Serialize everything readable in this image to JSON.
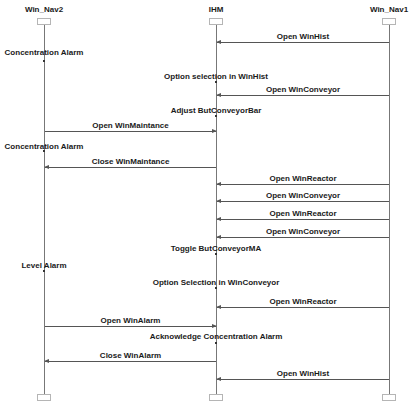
{
  "lifelines": [
    {
      "id": "nav2",
      "label": "Win_Nav2",
      "x": 44
    },
    {
      "id": "ihm",
      "label": "IHM",
      "x": 216
    },
    {
      "id": "nav1",
      "label": "Win_Nav1",
      "x": 389
    }
  ],
  "messages": [
    {
      "label": "Open WinHist",
      "from": "Win_Nav1",
      "to": "IHM",
      "y": 42
    },
    {
      "label": "Open WinConveyor",
      "from": "Win_Nav1",
      "to": "IHM",
      "y": 95
    },
    {
      "label": "Open WinMaintance",
      "from": "Win_Nav2",
      "to": "IHM",
      "y": 131
    },
    {
      "label": "Close WinMaintance",
      "from": "IHM",
      "to": "Win_Nav2",
      "y": 167
    },
    {
      "label": "Open WinReactor",
      "from": "Win_Nav1",
      "to": "IHM",
      "y": 184
    },
    {
      "label": "Open WinConveyor",
      "from": "Win_Nav1",
      "to": "IHM",
      "y": 201
    },
    {
      "label": "Open WinReactor",
      "from": "Win_Nav1",
      "to": "IHM",
      "y": 219
    },
    {
      "label": "Open WinConveyor",
      "from": "Win_Nav1",
      "to": "IHM",
      "y": 237
    },
    {
      "label": "Open WinReactor",
      "from": "Win_Nav1",
      "to": "IHM",
      "y": 307
    },
    {
      "label": "Open WinAlarm",
      "from": "Win_Nav2",
      "to": "IHM",
      "y": 326
    },
    {
      "label": "Close WinAlarm",
      "from": "IHM",
      "to": "Win_Nav2",
      "y": 361
    },
    {
      "label": "Open WinHist",
      "from": "Win_Nav1",
      "to": "IHM",
      "y": 379
    }
  ],
  "events": [
    {
      "label": "Concentration Alarm",
      "on": "Win_Nav2",
      "y": 51
    },
    {
      "label": "Option selection  in WinHist",
      "on": "IHM",
      "y": 75
    },
    {
      "label": "Adjust ButConveyorBar",
      "on": "IHM",
      "y": 109
    },
    {
      "label": "Concentration Alarm",
      "on": "Win_Nav2",
      "y": 145
    },
    {
      "label": "Toggle ButConveyorMA",
      "on": "IHM",
      "y": 247
    },
    {
      "label": "Level Alarm",
      "on": "Win_Nav2",
      "y": 264
    },
    {
      "label": "Option Selection in WinConveyor",
      "on": "IHM",
      "y": 281
    },
    {
      "label": "Acknowledge Concentration Alarm",
      "on": "IHM",
      "y": 335
    }
  ]
}
